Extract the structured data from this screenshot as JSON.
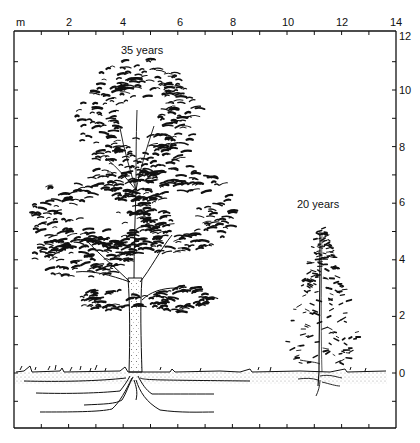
{
  "figure": {
    "unit_label": "m",
    "x_axis": {
      "ticks": [
        {
          "value": 2,
          "label": "2",
          "px": 69
        },
        {
          "value": 4,
          "label": "4",
          "px": 123
        },
        {
          "value": 6,
          "label": "6",
          "px": 180
        },
        {
          "value": 8,
          "label": "8",
          "px": 233
        },
        {
          "value": 10,
          "label": "10",
          "px": 288
        },
        {
          "value": 12,
          "label": "12",
          "px": 342
        },
        {
          "value": 14,
          "label": "14",
          "px": 396
        }
      ],
      "range": [
        0,
        14
      ]
    },
    "y_axis": {
      "ticks": [
        {
          "value": 12,
          "label": "12",
          "px": 36
        },
        {
          "value": 10,
          "label": "10",
          "px": 90
        },
        {
          "value": 8,
          "label": "8",
          "px": 147
        },
        {
          "value": 6,
          "label": "6",
          "px": 202
        },
        {
          "value": 4,
          "label": "4",
          "px": 259
        },
        {
          "value": 2,
          "label": "2",
          "px": 315
        },
        {
          "value": 0,
          "label": "0",
          "px": 373
        }
      ],
      "range": [
        -2,
        12
      ]
    },
    "trees": [
      {
        "label": "35 years",
        "x_m": 4.4,
        "height_m": 11.3
      },
      {
        "label": "20 years",
        "x_m": 11.2,
        "height_m": 5.1
      }
    ],
    "colors": {
      "ink": "#111111",
      "soil_dots": "#9a9a9a",
      "background": "#ffffff"
    }
  }
}
